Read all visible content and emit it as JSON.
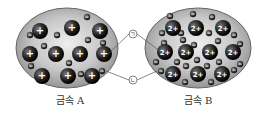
{
  "diagram": {
    "metal_a": {
      "label": "금속 A",
      "cation_charge": "+",
      "cations": [
        [
          40,
          31
        ],
        [
          72,
          28
        ],
        [
          100,
          31
        ],
        [
          30,
          54
        ],
        [
          56,
          54
        ],
        [
          80,
          54
        ],
        [
          104,
          54
        ],
        [
          42,
          76
        ],
        [
          68,
          76
        ],
        [
          92,
          76
        ]
      ],
      "electrons": [
        [
          87,
          17
        ],
        [
          30,
          35
        ],
        [
          57,
          35
        ],
        [
          88,
          40
        ],
        [
          103,
          43
        ],
        [
          44,
          46
        ],
        [
          69,
          63
        ],
        [
          31,
          66
        ],
        [
          81,
          74
        ],
        [
          102,
          71
        ]
      ]
    },
    "metal_b": {
      "label": "금속 B",
      "cation_charge": "2+",
      "cations": [
        [
          173,
          28
        ],
        [
          196,
          28
        ],
        [
          223,
          28
        ],
        [
          165,
          52
        ],
        [
          186,
          52
        ],
        [
          210,
          52
        ],
        [
          233,
          52
        ],
        [
          173,
          74
        ],
        [
          198,
          74
        ],
        [
          222,
          74
        ]
      ],
      "electrons": [
        [
          170,
          16
        ],
        [
          193,
          14
        ],
        [
          212,
          17
        ],
        [
          162,
          33
        ],
        [
          181,
          33
        ],
        [
          209,
          33
        ],
        [
          234,
          35
        ],
        [
          164,
          43
        ],
        [
          183,
          40
        ],
        [
          194,
          45
        ],
        [
          218,
          41
        ],
        [
          240,
          44
        ],
        [
          177,
          62
        ],
        [
          197,
          60
        ],
        [
          219,
          62
        ],
        [
          240,
          64
        ],
        [
          156,
          62
        ],
        [
          186,
          66
        ],
        [
          207,
          66
        ],
        [
          161,
          71
        ],
        [
          185,
          82
        ],
        [
          211,
          82
        ],
        [
          234,
          70
        ]
      ]
    },
    "markers": [
      {
        "id": "marker-a",
        "label": "㉠",
        "x": 133,
        "y": 34,
        "points_to": [
          104,
          54
        ],
        "points_to_b": [
          165,
          52
        ]
      },
      {
        "id": "marker-b",
        "label": "㉡",
        "x": 133,
        "y": 80,
        "points_to": [
          102,
          71
        ],
        "points_to_b": [
          161,
          71
        ]
      }
    ]
  }
}
